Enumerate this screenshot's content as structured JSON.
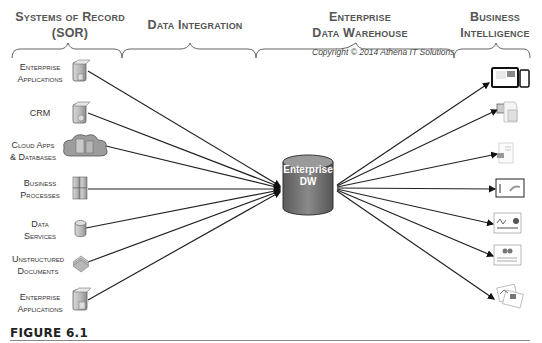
{
  "headers": {
    "sor": [
      "Systems of Record",
      "(SOR)"
    ],
    "integration": [
      "Data Integration"
    ],
    "edw": [
      "Enterprise",
      "Data Warehouse"
    ],
    "bi": [
      "Business",
      "Intelligence"
    ]
  },
  "copyright": "Copyright © 2014 Athena IT Solutions",
  "center": {
    "lines": [
      "Enterprise",
      "DW"
    ]
  },
  "sources": [
    {
      "lines": [
        "Enterprise",
        "Applications"
      ],
      "icon": "server-icon"
    },
    {
      "lines": [
        "CRM"
      ],
      "icon": "server-icon"
    },
    {
      "lines": [
        "Cloud Apps",
        "& Databases"
      ],
      "icon": "cloud-server-icon"
    },
    {
      "lines": [
        "Business",
        "Processes"
      ],
      "icon": "server-stack-icon"
    },
    {
      "lines": [
        "Data",
        "Services"
      ],
      "icon": "database-icon"
    },
    {
      "lines": [
        "Unstructured",
        "Documents"
      ],
      "icon": "documents-icon"
    },
    {
      "lines": [
        "Enterprise",
        "Applications"
      ],
      "icon": "server-icon"
    }
  ],
  "targets": [
    {
      "icon": "tablet-phone-dashboard-icon"
    },
    {
      "icon": "office-documents-icon"
    },
    {
      "icon": "report-page-icon"
    },
    {
      "icon": "chart-screen-icon"
    },
    {
      "icon": "dashboard-report-icon"
    },
    {
      "icon": "scorecard-report-icon"
    },
    {
      "icon": "stacked-reports-icon"
    }
  ],
  "figure_label": "FIGURE 6.1"
}
